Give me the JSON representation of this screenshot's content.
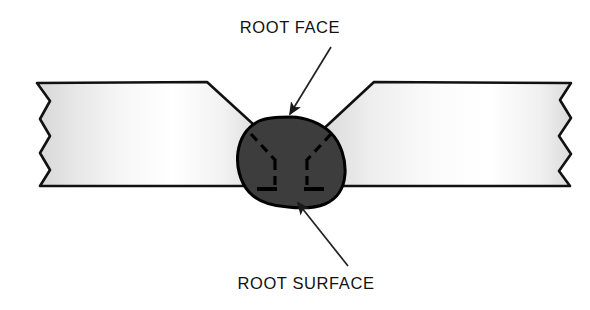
{
  "diagram": {
    "background_color": "#ffffff"
  },
  "labels": {
    "root_face": "ROOT FACE",
    "root_surface": "ROOT SURFACE"
  },
  "colors": {
    "outline": "#111111",
    "weld_bead_fill": "#3d3d3d",
    "weld_bead_outline": "#000000",
    "plate_fill_light": "#ffffff",
    "plate_fill_shade": "#dcdcdc",
    "dash_mark": "#000000",
    "leader_line": "#222222",
    "background": "#ffffff"
  },
  "geometry": {
    "plate_top_y": 82,
    "plate_bottom_y": 186,
    "left_plate_outer_x": 37,
    "right_plate_outer_x": 573,
    "left_bevel_vertex_x": 207,
    "right_bevel_vertex_x": 374,
    "weld_center_x": 291,
    "weld_bead_top_y": 118,
    "weld_bead_bottom_y": 206
  },
  "annotations": [
    {
      "name": "root-face-callout",
      "label": "ROOT FACE",
      "text_x": 290,
      "text_y": 33,
      "leader_from": [
        327,
        48
      ],
      "leader_to": [
        288,
        117
      ],
      "arrow_direction": "down-left"
    },
    {
      "name": "root-surface-callout",
      "label": "ROOT SURFACE",
      "text_x": 262,
      "text_y": 290,
      "leader_from": [
        345,
        262
      ],
      "leader_to": [
        296,
        200
      ],
      "arrow_direction": "up-left"
    }
  ],
  "weld_marks": {
    "description": "dashed fusion-line marks inside weld bead",
    "segments": [
      {
        "name": "left-diagonal",
        "x1": 251,
        "y1": 134,
        "x2": 275,
        "y2": 160
      },
      {
        "name": "right-diagonal",
        "x1": 331,
        "y1": 134,
        "x2": 307,
        "y2": 160
      },
      {
        "name": "left-vertical",
        "x1": 274,
        "y1": 160,
        "x2": 274,
        "y2": 186
      },
      {
        "name": "right-vertical",
        "x1": 307,
        "y1": 160,
        "x2": 307,
        "y2": 186
      },
      {
        "name": "bottom-left-tick",
        "x1": 258,
        "y1": 188,
        "x2": 276,
        "y2": 188
      },
      {
        "name": "bottom-right-tick",
        "x1": 305,
        "y1": 188,
        "x2": 323,
        "y2": 188
      }
    ]
  }
}
